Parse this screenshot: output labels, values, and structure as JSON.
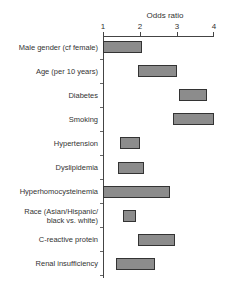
{
  "chart_data": {
    "type": "bar",
    "subtype": "horizontal-floating-range",
    "title": "",
    "xlabel": "Odds ratio",
    "ylabel": "",
    "xlim": [
      1,
      4
    ],
    "xticks": [
      1,
      2,
      3,
      4
    ],
    "x_axis_position": "top",
    "grid": false,
    "legend": null,
    "bar_color": "#8c8c8c",
    "border_color": "#333333",
    "categories": [
      "Male gender (cf female)",
      "Age (per 10 years)",
      "Diabetes",
      "Smoking",
      "Hypertension",
      "Dyslipidemia",
      "Hyperhomocysteinemia",
      "Race (Asian/Hispanic/ black vs. white)",
      "C-reactive protein",
      "Renal insufficiency"
    ],
    "series": [
      {
        "name": "Odds ratio range",
        "low": [
          1.0,
          1.95,
          3.05,
          2.9,
          1.45,
          1.4,
          1.0,
          1.55,
          1.95,
          1.35
        ],
        "high": [
          2.05,
          3.0,
          3.8,
          4.0,
          2.0,
          2.1,
          2.8,
          1.9,
          2.95,
          2.4
        ]
      }
    ]
  },
  "labels": {
    "xtitle": "Odds ratio",
    "xticks": [
      "1",
      "2",
      "3",
      "4"
    ],
    "rows": [
      {
        "line1": "Male gender (cf female)",
        "line2": ""
      },
      {
        "line1": "Age (per 10 years)",
        "line2": ""
      },
      {
        "line1": "Diabetes",
        "line2": ""
      },
      {
        "line1": "Smoking",
        "line2": ""
      },
      {
        "line1": "Hypertension",
        "line2": ""
      },
      {
        "line1": "Dyslipidemia",
        "line2": ""
      },
      {
        "line1": "Hyperhomocysteinemia",
        "line2": ""
      },
      {
        "line1": "Race (Asian/Hispanic/",
        "line2": "black vs. white)"
      },
      {
        "line1": "C-reactive protein",
        "line2": ""
      },
      {
        "line1": "Renal insufficiency",
        "line2": ""
      }
    ]
  }
}
